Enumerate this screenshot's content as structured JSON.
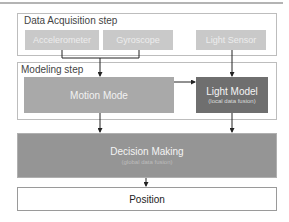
{
  "diagram": {
    "acquisition": {
      "label": "Data Acquisition step",
      "sensors": [
        {
          "label": "Accelerometer"
        },
        {
          "label": "Gyroscope"
        },
        {
          "label": "Light Sensor"
        }
      ]
    },
    "modeling": {
      "label": "Modeling step",
      "motion_mode": {
        "label": "Motion Mode"
      },
      "light_model": {
        "label": "Light Model",
        "sublabel": "(local data fusion)"
      }
    },
    "decision": {
      "label": "Decision Making",
      "sublabel": "(global data fusion)"
    },
    "position": {
      "label": "Position"
    },
    "colors": {
      "sensor_fill": "#c9c9c9",
      "motion_fill": "#a9a9a9",
      "light_model_fill": "#6f6f6f",
      "decision_fill": "#959595",
      "arrow": "#222222"
    }
  }
}
